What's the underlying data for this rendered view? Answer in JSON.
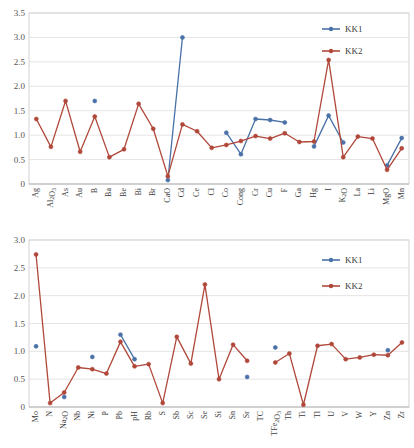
{
  "colors": {
    "kk1": "#4A72A8",
    "kk2": "#B0483A",
    "grid": "#d9d9d9",
    "axis": "#b5b5b5",
    "text": "#3b3b3b",
    "background": "#ffffff"
  },
  "legend": {
    "position": "top-right",
    "entries": [
      {
        "label": "KK1",
        "color": "#4A72A8"
      },
      {
        "label": "KK2",
        "color": "#B0483A"
      }
    ]
  },
  "chart_data": [
    {
      "id": "chart-top",
      "type": "line",
      "title": "",
      "xlabel": "",
      "ylabel": "",
      "ylim": [
        0,
        3.5
      ],
      "yticks": [
        0,
        0.5,
        1.0,
        1.5,
        2.0,
        2.5,
        3.0,
        3.5
      ],
      "ytick_labels": [
        "0",
        "0.5",
        "1.0",
        "1.5",
        "2.0",
        "2.5",
        "3.0",
        "3.5"
      ],
      "grid": true,
      "categories": [
        "Ag",
        "Al2O3",
        "As",
        "Au",
        "B",
        "Ba",
        "Be",
        "Bi",
        "Br",
        "CaO",
        "Cd",
        "Ce",
        "Cl",
        "Co",
        "Cong",
        "Cr",
        "Cu",
        "F",
        "Ga",
        "Hg",
        "I",
        "K2O",
        "La",
        "Li",
        "MgO",
        "Mn"
      ],
      "category_labels": [
        "Ag",
        "Al₂O₃",
        "As",
        "Au",
        "B",
        "Ba",
        "Be",
        "Bi",
        "Br",
        "CaO",
        "Cd",
        "Ce",
        "Cl",
        "Co",
        "Cong",
        "Cr",
        "Cu",
        "F",
        "Ga",
        "Hg",
        "I",
        "K₂O",
        "La",
        "Li",
        "MgO",
        "Mn"
      ],
      "series": [
        {
          "name": "KK1",
          "color": "#4A72A8",
          "values": [
            null,
            null,
            null,
            null,
            1.7,
            null,
            null,
            null,
            null,
            0.08,
            3.0,
            null,
            null,
            1.05,
            0.61,
            1.33,
            1.31,
            1.26,
            null,
            0.77,
            1.4,
            0.85,
            null,
            null,
            0.38,
            0.94
          ]
        },
        {
          "name": "KK2",
          "color": "#B0483A",
          "values": [
            1.33,
            0.76,
            1.7,
            0.66,
            1.38,
            0.55,
            0.71,
            1.64,
            1.13,
            0.16,
            1.22,
            1.08,
            0.74,
            0.8,
            0.88,
            0.98,
            0.93,
            1.04,
            0.86,
            0.87,
            2.54,
            0.55,
            0.97,
            0.93,
            0.29,
            0.73
          ]
        }
      ]
    },
    {
      "id": "chart-bottom",
      "type": "line",
      "title": "",
      "xlabel": "",
      "ylabel": "",
      "ylim": [
        0,
        3.0
      ],
      "yticks": [
        0,
        0.5,
        1.0,
        1.5,
        2.0,
        2.5,
        3.0
      ],
      "ytick_labels": [
        "0",
        "0.5",
        "1.0",
        "1.5",
        "2.0",
        "2.5",
        "3.0"
      ],
      "grid": true,
      "categories": [
        "Mo",
        "N",
        "Na2O",
        "Nb",
        "Ni",
        "P",
        "Pb",
        "pH",
        "Rb",
        "S",
        "Sb",
        "Sc",
        "Se",
        "Si",
        "Sn",
        "Sr",
        "TC",
        "TFe2O3",
        "Th",
        "Ti",
        "Tl",
        "U",
        "V",
        "W",
        "Y",
        "Zn",
        "Zr"
      ],
      "category_labels": [
        "Mo",
        "N",
        "Na₂O",
        "Nb",
        "Ni",
        "P",
        "Pb",
        "pH",
        "Rb",
        "S",
        "Sb",
        "Sc",
        "Se",
        "Si",
        "Sn",
        "Sr",
        "TC",
        "TFe₂O₃",
        "Th",
        "Ti",
        "Tl",
        "U",
        "V",
        "W",
        "Y",
        "Zn",
        "Zr"
      ],
      "series": [
        {
          "name": "KK1",
          "color": "#4A72A8",
          "values": [
            1.09,
            null,
            0.18,
            null,
            0.9,
            null,
            1.3,
            0.86,
            null,
            null,
            null,
            null,
            null,
            null,
            null,
            0.54,
            null,
            1.07,
            null,
            null,
            null,
            null,
            null,
            null,
            null,
            1.02,
            null
          ]
        },
        {
          "name": "KK2",
          "color": "#B0483A",
          "values": [
            2.74,
            0.07,
            0.26,
            0.71,
            0.68,
            0.6,
            1.17,
            0.73,
            0.77,
            0.07,
            1.26,
            0.78,
            2.2,
            0.5,
            1.12,
            0.83,
            null,
            0.8,
            0.96,
            0.04,
            1.1,
            1.13,
            0.86,
            0.89,
            0.94,
            0.93,
            1.16
          ]
        }
      ]
    }
  ]
}
